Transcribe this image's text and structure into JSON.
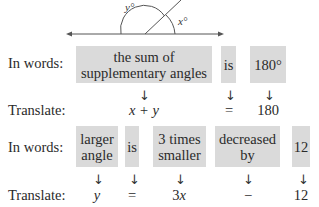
{
  "figure": {
    "angle_labels": {
      "left": "y°",
      "right": "x°"
    }
  },
  "row1": {
    "words_label": "In words:",
    "translate_label": "Translate:",
    "phrases": [
      {
        "line1": "the sum of",
        "line2": "supplementary angles"
      },
      {
        "line1": "is"
      },
      {
        "line1": "180°"
      }
    ],
    "arrow": "↓",
    "translations": [
      "x + y",
      "=",
      "180"
    ]
  },
  "row2": {
    "words_label": "In words:",
    "translate_label": "Translate:",
    "phrases": [
      {
        "line1": "larger",
        "line2": "angle"
      },
      {
        "line1": "is"
      },
      {
        "line1": "3 times",
        "line2": "smaller"
      },
      {
        "line1": "decreased",
        "line2": "by"
      },
      {
        "line1": "12"
      }
    ],
    "arrow": "↓",
    "translations": [
      "y",
      "=",
      "3x",
      "−",
      "12"
    ]
  }
}
